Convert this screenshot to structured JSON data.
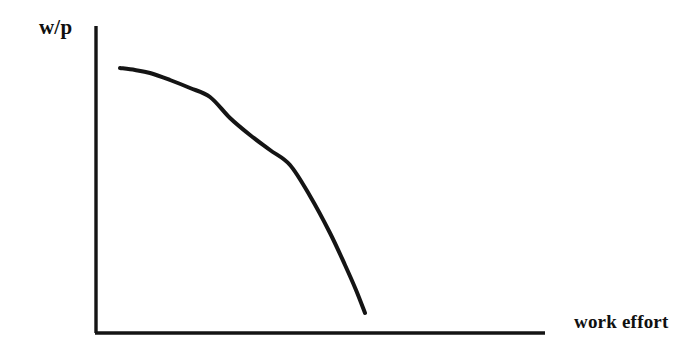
{
  "figure": {
    "background_color": "#ffffff",
    "ink_color": "#141414",
    "width": 700,
    "height": 355
  },
  "chart_data": {
    "type": "line",
    "title": "",
    "subtitle": "",
    "xlabel": "work effort",
    "ylabel": "w/p",
    "grid": false,
    "legend": null,
    "axes": {
      "x_axis": {
        "label": "work effort",
        "origin_px": [
          96,
          333
        ],
        "end_px": [
          545,
          333
        ],
        "ticks": [],
        "tick_labels": [],
        "arrow": false
      },
      "y_axis": {
        "label": "w/p",
        "origin_px": [
          96,
          333
        ],
        "end_px": [
          96,
          26
        ],
        "ticks": [],
        "tick_labels": [],
        "arrow": false
      }
    },
    "series": [
      {
        "name": "wage-effort curve",
        "style": "solid",
        "color": "#141414",
        "width_px": 4,
        "description": "downward sloping concave curve, flat at left and steeply falling at right",
        "points_px": [
          [
            120,
            68
          ],
          [
            135,
            70
          ],
          [
            150,
            73
          ],
          [
            170,
            80
          ],
          [
            190,
            88
          ],
          [
            210,
            97
          ],
          [
            230,
            118
          ],
          [
            250,
            135
          ],
          [
            270,
            150
          ],
          [
            290,
            165
          ],
          [
            310,
            196
          ],
          [
            330,
            233
          ],
          [
            345,
            265
          ],
          [
            356,
            290
          ],
          [
            365,
            313
          ]
        ]
      }
    ],
    "annotations": []
  },
  "labels": {
    "y_axis": "w/p",
    "x_axis": "work effort"
  }
}
